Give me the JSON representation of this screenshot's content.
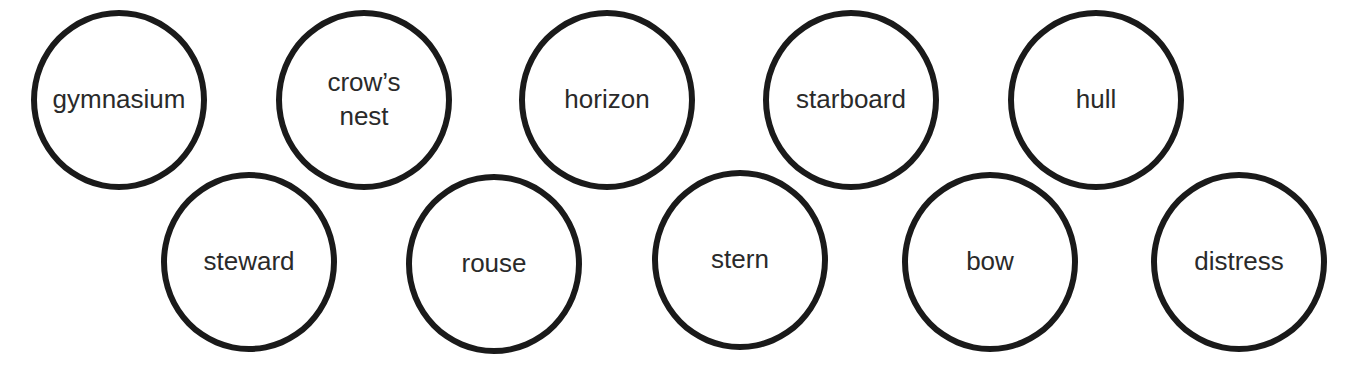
{
  "words": [
    {
      "label": "gymnasium",
      "cx": 117,
      "cy": 100
    },
    {
      "label": "crow’s nest",
      "cx": 362,
      "cy": 100
    },
    {
      "label": "horizon",
      "cx": 605,
      "cy": 100
    },
    {
      "label": "starboard",
      "cx": 849,
      "cy": 100
    },
    {
      "label": "hull",
      "cx": 1094,
      "cy": 100
    },
    {
      "label": "steward",
      "cx": 247,
      "cy": 262
    },
    {
      "label": "rouse",
      "cx": 492,
      "cy": 264
    },
    {
      "label": "stern",
      "cx": 738,
      "cy": 260
    },
    {
      "label": "bow",
      "cx": 988,
      "cy": 262
    },
    {
      "label": "distress",
      "cx": 1237,
      "cy": 262
    }
  ]
}
